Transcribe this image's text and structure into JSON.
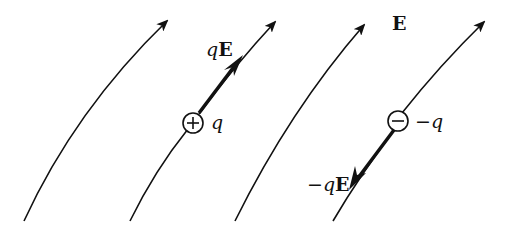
{
  "diagram": {
    "field_label": "E",
    "positive_charge": {
      "symbol": "+",
      "label": "q",
      "force_label": {
        "q": "q",
        "E": "E"
      }
    },
    "negative_charge": {
      "symbol": "−",
      "label": "−q",
      "force_label": {
        "q": "−q",
        "E": "E"
      }
    },
    "colors": {
      "line": "#111111",
      "background": "#ffffff"
    }
  }
}
